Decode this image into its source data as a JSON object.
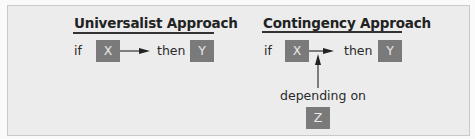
{
  "diagram": {
    "universalist": {
      "title": "Universalist Approach",
      "if_label": "if",
      "x_label": "X",
      "then_label": "then",
      "y_label": "Y"
    },
    "contingency": {
      "title": "Contingency Approach",
      "if_label": "if",
      "x_label": "X",
      "then_label": "then",
      "y_label": "Y",
      "moderator_label": "depending on",
      "z_label": "Z"
    },
    "colors": {
      "background": "#ececec",
      "box_fill": "#7a7a7a",
      "box_text": "#e8e8e8",
      "line": "#333333"
    }
  }
}
